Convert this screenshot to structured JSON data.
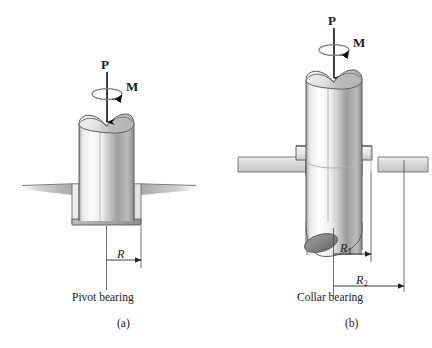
{
  "figure": {
    "background_color": "#ffffff",
    "ink_color": "#1a1a1a",
    "line_color": "#4a4a4a",
    "shaft_light": "#f4f4f4",
    "shaft_mid": "#d8d8d8",
    "shaft_dark": "#8f8f8f",
    "support_fill": "#d9d9d9"
  },
  "panels": [
    {
      "id": "a",
      "name": "pivot-bearing",
      "caption": "Pivot bearing",
      "subcaption": "(a)",
      "force_label": "P",
      "moment_label": "M",
      "dimensions": [
        {
          "label": "R",
          "sub": "",
          "name": "radius-R"
        }
      ]
    },
    {
      "id": "b",
      "name": "collar-bearing",
      "caption": "Collar bearing",
      "subcaption": "(b)",
      "force_label": "P",
      "moment_label": "M",
      "dimensions": [
        {
          "label": "R",
          "sub": "1",
          "name": "radius-R1"
        },
        {
          "label": "R",
          "sub": "2",
          "name": "radius-R2"
        }
      ]
    }
  ]
}
